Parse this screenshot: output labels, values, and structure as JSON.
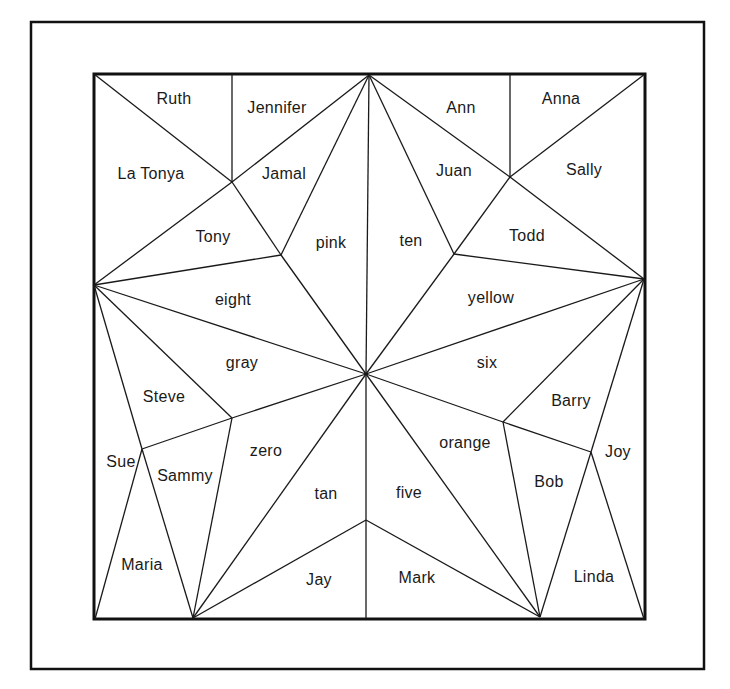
{
  "diagram": {
    "type": "star-quilt-puzzle",
    "regions": [
      {
        "id": "ruth",
        "label": "Ruth",
        "x": 174,
        "y": 99
      },
      {
        "id": "jennifer",
        "label": "Jennifer",
        "x": 277,
        "y": 108
      },
      {
        "id": "la-tonya",
        "label": "La Tonya",
        "x": 151,
        "y": 174
      },
      {
        "id": "jamal",
        "label": "Jamal",
        "x": 284,
        "y": 174
      },
      {
        "id": "tony",
        "label": "Tony",
        "x": 213,
        "y": 237
      },
      {
        "id": "pink",
        "label": "pink",
        "x": 331,
        "y": 243
      },
      {
        "id": "ten",
        "label": "ten",
        "x": 411,
        "y": 241
      },
      {
        "id": "ann",
        "label": "Ann",
        "x": 461,
        "y": 108
      },
      {
        "id": "anna",
        "label": "Anna",
        "x": 561,
        "y": 99
      },
      {
        "id": "juan",
        "label": "Juan",
        "x": 454,
        "y": 171
      },
      {
        "id": "sally",
        "label": "Sally",
        "x": 584,
        "y": 170
      },
      {
        "id": "todd",
        "label": "Todd",
        "x": 527,
        "y": 236
      },
      {
        "id": "eight",
        "label": "eight",
        "x": 233,
        "y": 300
      },
      {
        "id": "yellow",
        "label": "yellow",
        "x": 491,
        "y": 298
      },
      {
        "id": "gray",
        "label": "gray",
        "x": 242,
        "y": 363
      },
      {
        "id": "six",
        "label": "six",
        "x": 487,
        "y": 363
      },
      {
        "id": "steve",
        "label": "Steve",
        "x": 164,
        "y": 397
      },
      {
        "id": "barry",
        "label": "Barry",
        "x": 571,
        "y": 401
      },
      {
        "id": "sue",
        "label": "Sue",
        "x": 121,
        "y": 462
      },
      {
        "id": "sammy",
        "label": "Sammy",
        "x": 185,
        "y": 476
      },
      {
        "id": "zero",
        "label": "zero",
        "x": 266,
        "y": 451
      },
      {
        "id": "orange",
        "label": "orange",
        "x": 465,
        "y": 443
      },
      {
        "id": "joy",
        "label": "Joy",
        "x": 618,
        "y": 452
      },
      {
        "id": "bob",
        "label": "Bob",
        "x": 549,
        "y": 482
      },
      {
        "id": "tan",
        "label": "tan",
        "x": 326,
        "y": 494
      },
      {
        "id": "five",
        "label": "five",
        "x": 409,
        "y": 493
      },
      {
        "id": "maria",
        "label": "Maria",
        "x": 142,
        "y": 565
      },
      {
        "id": "jay",
        "label": "Jay",
        "x": 319,
        "y": 580
      },
      {
        "id": "mark",
        "label": "Mark",
        "x": 417,
        "y": 578
      },
      {
        "id": "linda",
        "label": "Linda",
        "x": 594,
        "y": 577
      }
    ],
    "frame": {
      "outer": [
        31,
        22,
        704,
        669
      ],
      "inner": [
        94,
        74,
        645,
        619
      ]
    },
    "points": {
      "T": [
        369,
        75
      ],
      "L": [
        94,
        285
      ],
      "R": [
        644,
        279
      ],
      "BLV": [
        193,
        618
      ],
      "BRV": [
        540,
        617
      ],
      "C": [
        366,
        374
      ],
      "IUL": [
        281,
        255
      ],
      "IUR": [
        454,
        254
      ],
      "ILL": [
        232,
        418
      ],
      "ILR": [
        503,
        422
      ],
      "IB": [
        366,
        520
      ],
      "JUL": [
        232,
        182
      ],
      "JUR": [
        510,
        177
      ],
      "JL": [
        142,
        449
      ],
      "JR": [
        591,
        452
      ],
      "TL": [
        94,
        74
      ],
      "TR": [
        645,
        74
      ],
      "BL": [
        95,
        619
      ],
      "BR": [
        644,
        619
      ],
      "TD1": [
        232,
        74
      ],
      "TD2": [
        510,
        74
      ],
      "BM": [
        366,
        619
      ]
    },
    "edges": [
      [
        "TL",
        "JUL"
      ],
      [
        "JUL",
        "TD1"
      ],
      [
        "JUL",
        "T"
      ],
      [
        "L",
        "JUL"
      ],
      [
        "JUL",
        "IUL"
      ],
      [
        "T",
        "IUL"
      ],
      [
        "T",
        "C"
      ],
      [
        "T",
        "IUR"
      ],
      [
        "T",
        "JUR"
      ],
      [
        "JUR",
        "R"
      ],
      [
        "TR",
        "JUR"
      ],
      [
        "JUR",
        "TD2"
      ],
      [
        "JUR",
        "IUR"
      ],
      [
        "L",
        "IUL"
      ],
      [
        "IUL",
        "C"
      ],
      [
        "L",
        "C"
      ],
      [
        "L",
        "ILL"
      ],
      [
        "IUR",
        "C"
      ],
      [
        "IUR",
        "R"
      ],
      [
        "R",
        "C"
      ],
      [
        "R",
        "ILR"
      ],
      [
        "L",
        "JL"
      ],
      [
        "JL",
        "BLV"
      ],
      [
        "JL",
        "BL"
      ],
      [
        "JL",
        "ILL"
      ],
      [
        "ILL",
        "C"
      ],
      [
        "ILL",
        "BLV"
      ],
      [
        "BLV",
        "C"
      ],
      [
        "BLV",
        "IB"
      ],
      [
        "C",
        "BM"
      ],
      [
        "IB",
        "BRV"
      ],
      [
        "C",
        "BRV"
      ],
      [
        "ILR",
        "C"
      ],
      [
        "ILR",
        "BRV"
      ],
      [
        "ILR",
        "JR"
      ],
      [
        "R",
        "JR"
      ],
      [
        "JR",
        "BRV"
      ],
      [
        "JR",
        "BR"
      ]
    ]
  }
}
